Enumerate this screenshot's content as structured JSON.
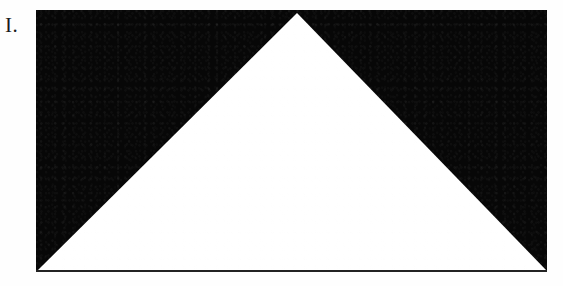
{
  "figure": {
    "label": "I.",
    "plate": {
      "background_color": "#070707",
      "foreground_color": "#ffffff",
      "baseline_color": "#232323",
      "shape_name": "white-triangle",
      "shape_kind": "isosceles-triangle",
      "frame": {
        "x": 36,
        "y": 10,
        "width": 511,
        "height": 262
      },
      "vertices": {
        "apex": {
          "x": 261,
          "y": 3
        },
        "base_left": {
          "x": 1,
          "y": 261
        },
        "base_right": {
          "x": 511,
          "y": 261
        }
      },
      "polygon_points": "261,3 511,261 1,261"
    }
  }
}
